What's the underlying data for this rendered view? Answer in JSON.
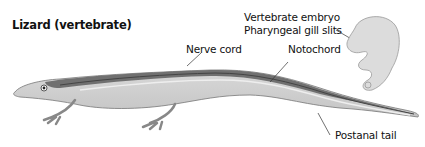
{
  "diagram": {
    "title": "Lizard (vertebrate)",
    "labels": {
      "nerve_cord": "Nerve cord",
      "notochord": "Notochord",
      "embryo": "Vertebrate embryo",
      "gill_slits": "Pharyngeal gill slits",
      "postanal_tail": "Postanal tail"
    }
  }
}
